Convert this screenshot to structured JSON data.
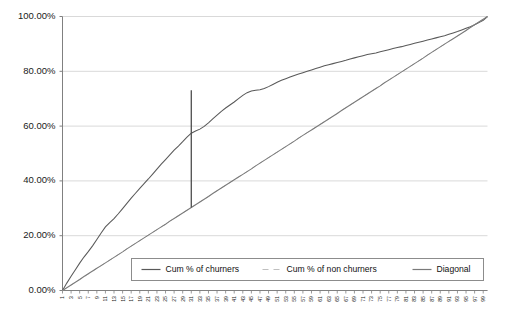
{
  "chart_data": {
    "type": "line",
    "title": "",
    "subtitle": "",
    "xlabel": "",
    "ylabel": "",
    "xlim": [
      1,
      100
    ],
    "ylim": [
      0,
      1
    ],
    "grid": true,
    "grid_axis": "y",
    "legend_position": "inside-bottom-center",
    "y_tick_labels": [
      "0.00%",
      "20.00%",
      "40.00%",
      "60.00%",
      "80.00%",
      "100.00%"
    ],
    "y_tick_values": [
      0,
      0.2,
      0.4,
      0.6,
      0.8,
      1.0
    ],
    "x_tick_labels": [
      "1",
      "3",
      "5",
      "7",
      "9",
      "11",
      "13",
      "15",
      "17",
      "19",
      "21",
      "23",
      "25",
      "27",
      "29",
      "31",
      "33",
      "35",
      "37",
      "39",
      "41",
      "43",
      "45",
      "47",
      "49",
      "51",
      "53",
      "55",
      "57",
      "59",
      "61",
      "63",
      "65",
      "67",
      "69",
      "71",
      "73",
      "75",
      "77",
      "79",
      "81",
      "83",
      "85",
      "87",
      "89",
      "91",
      "93",
      "95",
      "97",
      "99"
    ],
    "x_tick_values": [
      1,
      3,
      5,
      7,
      9,
      11,
      13,
      15,
      17,
      19,
      21,
      23,
      25,
      27,
      29,
      31,
      33,
      35,
      37,
      39,
      41,
      43,
      45,
      47,
      49,
      51,
      53,
      55,
      57,
      59,
      61,
      63,
      65,
      67,
      69,
      71,
      73,
      75,
      77,
      79,
      81,
      83,
      85,
      87,
      89,
      91,
      93,
      95,
      97,
      99
    ],
    "x": [
      1,
      2,
      3,
      4,
      5,
      6,
      7,
      8,
      9,
      10,
      11,
      12,
      13,
      14,
      15,
      16,
      17,
      18,
      19,
      20,
      21,
      22,
      23,
      24,
      25,
      26,
      27,
      28,
      29,
      30,
      31,
      32,
      33,
      34,
      35,
      36,
      37,
      38,
      39,
      40,
      41,
      42,
      43,
      44,
      45,
      46,
      47,
      48,
      49,
      50,
      51,
      52,
      53,
      54,
      55,
      56,
      57,
      58,
      59,
      60,
      61,
      62,
      63,
      64,
      65,
      66,
      67,
      68,
      69,
      70,
      71,
      72,
      73,
      74,
      75,
      76,
      77,
      78,
      79,
      80,
      81,
      82,
      83,
      84,
      85,
      86,
      87,
      88,
      89,
      90,
      91,
      92,
      93,
      94,
      95,
      96,
      97,
      98,
      99,
      100
    ],
    "series": [
      {
        "name": "Cum % of churners",
        "color": "#595959",
        "style": "solid",
        "values": [
          0.0,
          0.027,
          0.052,
          0.076,
          0.1,
          0.122,
          0.142,
          0.163,
          0.186,
          0.21,
          0.232,
          0.248,
          0.262,
          0.28,
          0.299,
          0.318,
          0.337,
          0.355,
          0.373,
          0.39,
          0.407,
          0.425,
          0.443,
          0.461,
          0.478,
          0.495,
          0.512,
          0.527,
          0.543,
          0.56,
          0.574,
          0.582,
          0.589,
          0.599,
          0.612,
          0.626,
          0.64,
          0.654,
          0.666,
          0.677,
          0.688,
          0.7,
          0.712,
          0.722,
          0.728,
          0.731,
          0.733,
          0.737,
          0.744,
          0.752,
          0.76,
          0.767,
          0.773,
          0.779,
          0.785,
          0.79,
          0.795,
          0.8,
          0.805,
          0.81,
          0.815,
          0.82,
          0.824,
          0.828,
          0.832,
          0.836,
          0.84,
          0.845,
          0.849,
          0.853,
          0.857,
          0.861,
          0.864,
          0.867,
          0.871,
          0.875,
          0.879,
          0.883,
          0.887,
          0.89,
          0.894,
          0.898,
          0.902,
          0.906,
          0.91,
          0.914,
          0.918,
          0.922,
          0.926,
          0.93,
          0.935,
          0.94,
          0.945,
          0.951,
          0.957,
          0.963,
          0.97,
          0.978,
          0.986,
          1.0
        ]
      },
      {
        "name": "Cum % of non churners",
        "color": "#bfbfbf",
        "style": "dashed",
        "values": [
          0.0,
          0.01,
          0.02,
          0.03,
          0.04,
          0.05,
          0.06,
          0.07,
          0.081,
          0.091,
          0.101,
          0.111,
          0.121,
          0.131,
          0.141,
          0.152,
          0.162,
          0.172,
          0.182,
          0.192,
          0.202,
          0.212,
          0.222,
          0.232,
          0.242,
          0.253,
          0.263,
          0.273,
          0.283,
          0.293,
          0.303,
          0.313,
          0.323,
          0.333,
          0.343,
          0.354,
          0.364,
          0.374,
          0.384,
          0.394,
          0.404,
          0.414,
          0.424,
          0.434,
          0.444,
          0.455,
          0.465,
          0.475,
          0.485,
          0.495,
          0.505,
          0.515,
          0.525,
          0.535,
          0.545,
          0.556,
          0.566,
          0.576,
          0.586,
          0.596,
          0.606,
          0.616,
          0.626,
          0.636,
          0.646,
          0.657,
          0.667,
          0.677,
          0.687,
          0.697,
          0.707,
          0.717,
          0.727,
          0.737,
          0.747,
          0.758,
          0.768,
          0.778,
          0.788,
          0.798,
          0.808,
          0.818,
          0.828,
          0.838,
          0.848,
          0.859,
          0.869,
          0.879,
          0.889,
          0.899,
          0.909,
          0.919,
          0.929,
          0.939,
          0.949,
          0.96,
          0.97,
          0.98,
          0.99,
          1.0
        ]
      },
      {
        "name": "Diagonal",
        "color": "#7a7a7a",
        "style": "solid",
        "values": [
          0.0,
          0.01,
          0.02,
          0.03,
          0.04,
          0.051,
          0.061,
          0.071,
          0.081,
          0.091,
          0.101,
          0.111,
          0.121,
          0.131,
          0.141,
          0.152,
          0.162,
          0.172,
          0.182,
          0.192,
          0.202,
          0.212,
          0.222,
          0.232,
          0.242,
          0.253,
          0.263,
          0.273,
          0.283,
          0.293,
          0.303,
          0.313,
          0.323,
          0.333,
          0.343,
          0.354,
          0.364,
          0.374,
          0.384,
          0.394,
          0.404,
          0.414,
          0.424,
          0.434,
          0.444,
          0.455,
          0.465,
          0.475,
          0.485,
          0.495,
          0.505,
          0.515,
          0.525,
          0.535,
          0.545,
          0.556,
          0.566,
          0.576,
          0.586,
          0.596,
          0.606,
          0.616,
          0.626,
          0.636,
          0.646,
          0.657,
          0.667,
          0.677,
          0.687,
          0.697,
          0.707,
          0.717,
          0.727,
          0.737,
          0.747,
          0.758,
          0.768,
          0.778,
          0.788,
          0.798,
          0.808,
          0.818,
          0.828,
          0.838,
          0.848,
          0.859,
          0.869,
          0.879,
          0.889,
          0.899,
          0.909,
          0.919,
          0.929,
          0.939,
          0.949,
          0.96,
          0.97,
          0.98,
          0.99,
          1.0
        ]
      }
    ],
    "annotations": [
      {
        "name": "ks-vertical-line",
        "type": "vline-segment",
        "x": 31,
        "y_bottom": 0.303,
        "y_top": 0.731,
        "color": "#4d4d4d"
      }
    ]
  },
  "legend": {
    "entries": [
      {
        "label": "Cum % of churners",
        "color": "#595959",
        "style": "solid"
      },
      {
        "label": "Cum % of non churners",
        "color": "#bfbfbf",
        "style": "dashed"
      },
      {
        "label": "Diagonal",
        "color": "#7a7a7a",
        "style": "solid"
      }
    ]
  },
  "axes": {
    "grid_color": "#d9d9d9",
    "axis_color": "#808080"
  }
}
